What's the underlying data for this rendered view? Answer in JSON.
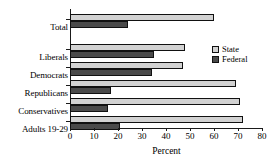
{
  "chart_data": {
    "type": "bar",
    "orientation": "horizontal",
    "title": "",
    "xlabel": "Percent",
    "ylabel": "",
    "xlim": [
      0,
      80
    ],
    "xticks": [
      0,
      10,
      20,
      30,
      40,
      50,
      60,
      70,
      80
    ],
    "grid": false,
    "legend_position": "right",
    "categories": [
      "Total",
      "Liberals",
      "Democrats",
      "Republicans",
      "Conservatives",
      "Adults 19-29"
    ],
    "series": [
      {
        "name": "State",
        "color": "#d2d2d2",
        "values": [
          60,
          48,
          47,
          69,
          71,
          72
        ]
      },
      {
        "name": "Federal",
        "color": "#4a4a4a",
        "values": [
          24,
          35,
          34,
          17,
          16,
          21
        ]
      }
    ]
  },
  "legend": {
    "items": [
      {
        "label": "State"
      },
      {
        "label": "Federal"
      }
    ]
  },
  "axis": {
    "x_title": "Percent",
    "tick_labels": [
      "0",
      "10",
      "20",
      "30",
      "40",
      "50",
      "60",
      "70",
      "80"
    ]
  }
}
